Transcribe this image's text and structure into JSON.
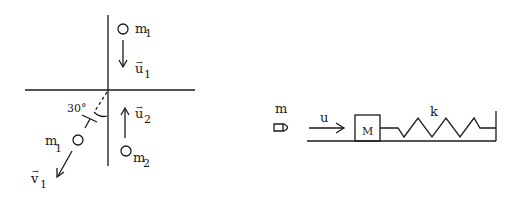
{
  "collision_diagram": {
    "mass_top_label": "m",
    "mass_top_sub": "1",
    "velocity_top_label": "u",
    "velocity_top_sub": "1",
    "angle_label": "30°",
    "velocity_bottom_label": "u",
    "velocity_bottom_sub": "2",
    "mass_bottom_label": "m",
    "mass_bottom_sub": "2",
    "mass_out_label": "m",
    "mass_out_sub": "1",
    "velocity_out_label": "v",
    "velocity_out_sub": "1"
  },
  "spring_diagram": {
    "bullet_mass_label": "m",
    "bullet_velocity_label": "u",
    "block_label": "M",
    "spring_label": "k"
  },
  "colors": {
    "ink": "#1a1a1a",
    "background": "#ffffff"
  }
}
